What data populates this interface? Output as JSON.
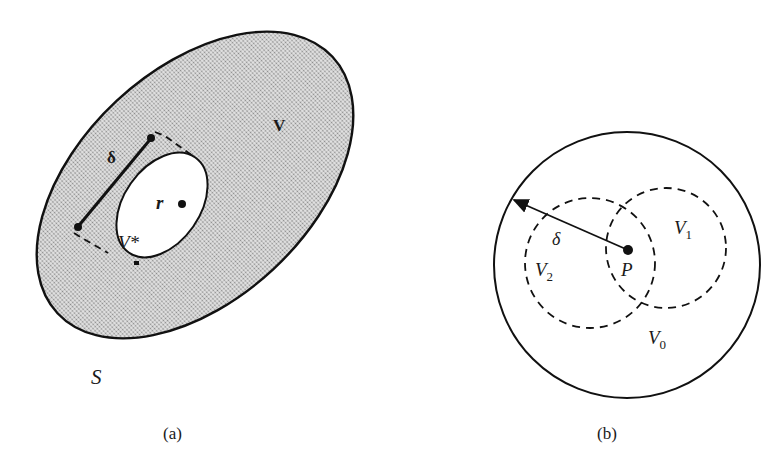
{
  "figure": {
    "panels": [
      {
        "id": "a",
        "caption": "(a)",
        "labels": {
          "outer_region": "V",
          "boundary": "S",
          "inner_region": "V*",
          "point": "r",
          "distance": "δ"
        }
      },
      {
        "id": "b",
        "caption": "(b)",
        "labels": {
          "outer_region": "V",
          "outer_region_sub": "0",
          "region1": "V",
          "region1_sub": "1",
          "region2": "V",
          "region2_sub": "2",
          "point": "P",
          "radius": "δ"
        }
      }
    ],
    "colors": {
      "stroke": "#111111",
      "shade": "#c9c9c9",
      "background": "#ffffff"
    }
  }
}
